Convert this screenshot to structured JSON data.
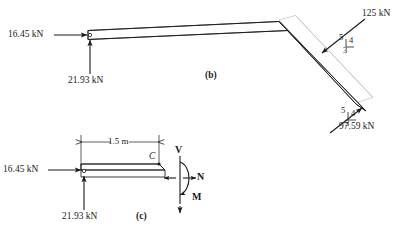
{
  "figure": {
    "caption_b": "(b)",
    "caption_c": "(c)"
  },
  "diagram_b": {
    "name": "bent-frame-free-body-diagram",
    "reaction_horizontal": "16.45 kN",
    "reaction_vertical": "21.93 kN",
    "load_upper": "125 kN",
    "load_lower": "97.59 kN",
    "slope_upper": {
      "hyp": "5",
      "vert": "4",
      "horiz": "3"
    },
    "slope_lower": {
      "hyp": "5",
      "vert": "4",
      "horiz": "3"
    }
  },
  "diagram_c": {
    "name": "segment-free-body-diagram",
    "dimension": "1.5 m",
    "point_label": "C",
    "reaction_horizontal": "16.45 kN",
    "reaction_vertical": "21.93 kN",
    "shear_label": "V",
    "normal_label": "N",
    "moment_label": "M"
  },
  "colors": {
    "line": "#1a1a1a",
    "ghost": "#b9b9b9",
    "background": "#ffffff"
  }
}
